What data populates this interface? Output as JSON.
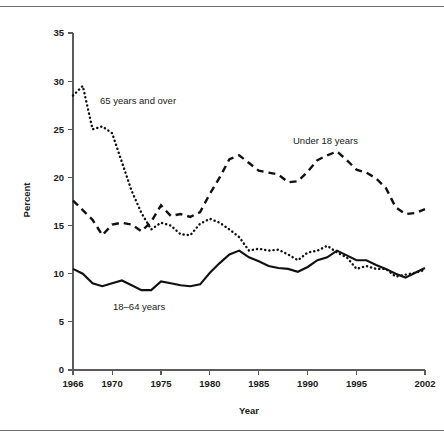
{
  "figure": {
    "clipped_header_text": "",
    "y_axis_title": "Percent",
    "x_axis_title": "Year"
  },
  "chart_data": {
    "type": "line",
    "title": "",
    "xlabel": "Year",
    "ylabel": "Percent",
    "xlim": [
      1966,
      2002
    ],
    "ylim": [
      0,
      35
    ],
    "yticks": [
      0,
      5,
      10,
      15,
      20,
      25,
      30,
      35
    ],
    "xticks": [
      1966,
      1970,
      1975,
      1980,
      1985,
      1990,
      1995,
      2002
    ],
    "grid": false,
    "legend": "inline-annotations",
    "x": [
      1966,
      1967,
      1968,
      1969,
      1970,
      1971,
      1972,
      1973,
      1974,
      1975,
      1976,
      1977,
      1978,
      1979,
      1980,
      1981,
      1982,
      1983,
      1984,
      1985,
      1986,
      1987,
      1988,
      1989,
      1990,
      1991,
      1992,
      1993,
      1994,
      1995,
      1996,
      1997,
      1998,
      1999,
      2000,
      2001,
      2002
    ],
    "series": [
      {
        "name": "65 years and over",
        "style": "dotted",
        "values": [
          28.5,
          29.5,
          25.0,
          25.3,
          24.6,
          21.6,
          18.6,
          16.3,
          14.6,
          15.3,
          15.0,
          14.1,
          14.0,
          15.2,
          15.7,
          15.3,
          14.6,
          13.8,
          12.4,
          12.6,
          12.4,
          12.5,
          12.0,
          11.4,
          12.2,
          12.4,
          12.9,
          12.2,
          11.7,
          10.5,
          10.8,
          10.5,
          10.5,
          9.7,
          9.9,
          10.1,
          10.4
        ]
      },
      {
        "name": "Under 18 years",
        "style": "dashed",
        "values": [
          17.6,
          16.6,
          15.6,
          14.0,
          15.1,
          15.3,
          15.1,
          14.4,
          15.4,
          17.1,
          16.0,
          16.2,
          15.9,
          16.4,
          18.3,
          20.0,
          21.9,
          22.3,
          21.5,
          20.7,
          20.5,
          20.3,
          19.5,
          19.6,
          20.6,
          21.8,
          22.3,
          22.7,
          21.8,
          20.8,
          20.5,
          19.9,
          18.9,
          16.9,
          16.2,
          16.3,
          16.7
        ]
      },
      {
        "name": "18–64 years",
        "style": "solid",
        "values": [
          10.5,
          10.0,
          9.0,
          8.7,
          9.0,
          9.3,
          8.8,
          8.3,
          8.3,
          9.2,
          9.0,
          8.8,
          8.7,
          8.9,
          10.1,
          11.1,
          12.0,
          12.4,
          11.7,
          11.3,
          10.8,
          10.6,
          10.5,
          10.2,
          10.7,
          11.4,
          11.7,
          12.4,
          11.9,
          11.4,
          11.4,
          10.9,
          10.5,
          10.0,
          9.6,
          10.1,
          10.6
        ]
      }
    ],
    "annotations": [
      {
        "text": "65 years and over",
        "x_px": 100,
        "y_px": 104
      },
      {
        "text": "Under 18 years",
        "x_px": 293,
        "y_px": 144
      },
      {
        "text": "18–64 years",
        "x_px": 113,
        "y_px": 310
      }
    ]
  }
}
